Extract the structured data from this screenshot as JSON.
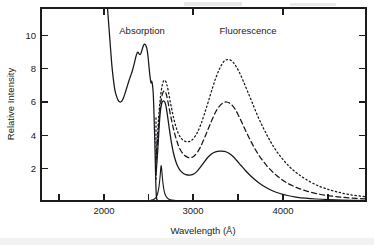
{
  "figure": {
    "background_color": "#ffffff",
    "ink_color": "#15161a"
  },
  "annotations": {
    "absorption_label": "Absorption",
    "fluorescence_label": "Fluorescence"
  },
  "axes": {
    "x_title": "Wavelength (Å)",
    "y_title": "Relative Intensity",
    "x_major_ticks": [
      "2000",
      "3000",
      "4000"
    ],
    "y_major_ticks": [
      "2",
      "4",
      "6",
      "8",
      "10"
    ]
  },
  "chart_data": {
    "type": "line",
    "title": "",
    "subtitle": "",
    "xlabel": "Wavelength (Å)",
    "ylabel": "Relative Intensity",
    "xlim": [
      1550,
      4800
    ],
    "ylim": [
      0,
      11.6
    ],
    "grid": false,
    "legend_position": "none",
    "frame": "box",
    "x_major_ticks": [
      2000,
      3000,
      4000
    ],
    "x_minor_ticks": [
      1500,
      2500,
      3500,
      4500
    ],
    "y_major_ticks": [
      2,
      4,
      6,
      8,
      10
    ],
    "y_minor_ticks": [],
    "annotations": [
      {
        "text": "Absorption",
        "x": 2530,
        "y": 10.6
      },
      {
        "text": "Fluorescence",
        "x": 3530,
        "y": 10.6
      }
    ],
    "series": [
      {
        "name": "Absorption",
        "style": "solid",
        "comment": "absorption band: descends from off-scale at 2200, min ~6.0 near 2350, rises to peak 9.4 at 2600, sharp cut-off at 2700",
        "points": [
          [
            2215,
            11.6
          ],
          [
            2230,
            10.4
          ],
          [
            2245,
            9.2
          ],
          [
            2258,
            8.2
          ],
          [
            2272,
            7.4
          ],
          [
            2288,
            6.7
          ],
          [
            2305,
            6.3
          ],
          [
            2322,
            6.05
          ],
          [
            2340,
            5.95
          ],
          [
            2358,
            6.0
          ],
          [
            2375,
            6.2
          ],
          [
            2392,
            6.5
          ],
          [
            2410,
            6.85
          ],
          [
            2428,
            7.2
          ],
          [
            2445,
            7.5
          ],
          [
            2462,
            7.8
          ],
          [
            2478,
            8.15
          ],
          [
            2492,
            8.5
          ],
          [
            2505,
            8.8
          ],
          [
            2518,
            8.95
          ],
          [
            2530,
            8.85
          ],
          [
            2542,
            8.8
          ],
          [
            2554,
            8.95
          ],
          [
            2566,
            9.2
          ],
          [
            2578,
            9.38
          ],
          [
            2590,
            9.42
          ],
          [
            2602,
            9.3
          ],
          [
            2612,
            9.05
          ],
          [
            2620,
            8.7
          ],
          [
            2628,
            8.2
          ],
          [
            2636,
            7.7
          ],
          [
            2643,
            7.35
          ],
          [
            2650,
            7.1
          ],
          [
            2656,
            7.2
          ],
          [
            2662,
            7.1
          ],
          [
            2668,
            6.8
          ],
          [
            2673,
            6.4
          ],
          [
            2678,
            5.6
          ],
          [
            2683,
            4.6
          ],
          [
            2688,
            3.6
          ],
          [
            2692,
            2.6
          ],
          [
            2696,
            1.6
          ],
          [
            2700,
            0.7
          ],
          [
            2705,
            0.2
          ],
          [
            2712,
            0.05
          ]
        ]
      },
      {
        "name": "Excitation line",
        "style": "solid",
        "comment": "narrow scattered-excitation spike at 2750, height 2.1",
        "points": [
          [
            2640,
            0.03
          ],
          [
            2670,
            0.08
          ],
          [
            2695,
            0.18
          ],
          [
            2712,
            0.35
          ],
          [
            2724,
            0.65
          ],
          [
            2734,
            1.05
          ],
          [
            2742,
            1.55
          ],
          [
            2748,
            2.0
          ],
          [
            2752,
            2.12
          ],
          [
            2757,
            1.9
          ],
          [
            2764,
            1.4
          ],
          [
            2772,
            0.95
          ],
          [
            2782,
            0.6
          ],
          [
            2794,
            0.36
          ],
          [
            2810,
            0.2
          ],
          [
            2830,
            0.11
          ],
          [
            2860,
            0.06
          ],
          [
            2900,
            0.03
          ],
          [
            2950,
            0.02
          ],
          [
            3000,
            0.02
          ]
        ]
      },
      {
        "name": "Fluorescence - lowest concentration (solid)",
        "style": "solid",
        "comment": "first band peak 6.0 at 2790, valley 1.55 at 3090, second band peak 3.0 at 3420, long tail",
        "points": [
          [
            2700,
            1.6
          ],
          [
            2708,
            2.2
          ],
          [
            2716,
            2.9
          ],
          [
            2724,
            3.7
          ],
          [
            2732,
            4.5
          ],
          [
            2740,
            5.15
          ],
          [
            2750,
            5.65
          ],
          [
            2762,
            5.95
          ],
          [
            2775,
            6.02
          ],
          [
            2788,
            5.95
          ],
          [
            2800,
            5.7
          ],
          [
            2812,
            5.25
          ],
          [
            2825,
            4.7
          ],
          [
            2840,
            4.05
          ],
          [
            2856,
            3.45
          ],
          [
            2874,
            2.9
          ],
          [
            2894,
            2.45
          ],
          [
            2916,
            2.1
          ],
          [
            2940,
            1.85
          ],
          [
            2968,
            1.68
          ],
          [
            3000,
            1.58
          ],
          [
            3035,
            1.55
          ],
          [
            3070,
            1.6
          ],
          [
            3105,
            1.75
          ],
          [
            3140,
            2.0
          ],
          [
            3178,
            2.3
          ],
          [
            3215,
            2.6
          ],
          [
            3255,
            2.82
          ],
          [
            3295,
            2.95
          ],
          [
            3340,
            3.0
          ],
          [
            3385,
            2.98
          ],
          [
            3425,
            2.88
          ],
          [
            3465,
            2.7
          ],
          [
            3505,
            2.45
          ],
          [
            3548,
            2.15
          ],
          [
            3592,
            1.85
          ],
          [
            3640,
            1.55
          ],
          [
            3690,
            1.28
          ],
          [
            3745,
            1.02
          ],
          [
            3805,
            0.8
          ],
          [
            3870,
            0.6
          ],
          [
            3940,
            0.45
          ],
          [
            4015,
            0.33
          ],
          [
            4100,
            0.24
          ],
          [
            4195,
            0.17
          ],
          [
            4300,
            0.12
          ],
          [
            4420,
            0.08
          ],
          [
            4560,
            0.05
          ],
          [
            4700,
            0.04
          ],
          [
            4790,
            0.03
          ]
        ]
      },
      {
        "name": "Fluorescence - medium concentration (dashed)",
        "style": "dashed",
        "comment": "first band peak ~6.6 at 2790, valley 2.6 at 3080, second band peak 5.95 at 3400",
        "points": [
          [
            2700,
            2.4
          ],
          [
            2710,
            3.2
          ],
          [
            2720,
            4.0
          ],
          [
            2730,
            4.8
          ],
          [
            2740,
            5.5
          ],
          [
            2752,
            6.05
          ],
          [
            2765,
            6.45
          ],
          [
            2778,
            6.6
          ],
          [
            2792,
            6.58
          ],
          [
            2806,
            6.35
          ],
          [
            2820,
            5.95
          ],
          [
            2836,
            5.45
          ],
          [
            2854,
            4.9
          ],
          [
            2874,
            4.35
          ],
          [
            2896,
            3.85
          ],
          [
            2920,
            3.4
          ],
          [
            2946,
            3.05
          ],
          [
            2975,
            2.8
          ],
          [
            3008,
            2.65
          ],
          [
            3042,
            2.6
          ],
          [
            3076,
            2.68
          ],
          [
            3110,
            2.9
          ],
          [
            3145,
            3.25
          ],
          [
            3182,
            3.75
          ],
          [
            3220,
            4.3
          ],
          [
            3258,
            4.85
          ],
          [
            3296,
            5.35
          ],
          [
            3335,
            5.7
          ],
          [
            3372,
            5.9
          ],
          [
            3408,
            5.95
          ],
          [
            3445,
            5.85
          ],
          [
            3482,
            5.6
          ],
          [
            3520,
            5.2
          ],
          [
            3560,
            4.7
          ],
          [
            3602,
            4.15
          ],
          [
            3648,
            3.6
          ],
          [
            3698,
            3.05
          ],
          [
            3752,
            2.55
          ],
          [
            3810,
            2.1
          ],
          [
            3875,
            1.7
          ],
          [
            3945,
            1.35
          ],
          [
            4020,
            1.05
          ],
          [
            4102,
            0.82
          ],
          [
            4192,
            0.62
          ],
          [
            4292,
            0.46
          ],
          [
            4400,
            0.34
          ],
          [
            4520,
            0.25
          ],
          [
            4650,
            0.18
          ],
          [
            4790,
            0.13
          ]
        ]
      },
      {
        "name": "Fluorescence - highest concentration (dotted)",
        "style": "dotted",
        "comment": "first band peak 7.25 at 2790, valley 3.6 at 3070, second band peak 8.5 at 3430",
        "points": [
          [
            2700,
            2.6
          ],
          [
            2710,
            3.5
          ],
          [
            2720,
            4.45
          ],
          [
            2730,
            5.3
          ],
          [
            2741,
            6.05
          ],
          [
            2753,
            6.65
          ],
          [
            2766,
            7.05
          ],
          [
            2780,
            7.25
          ],
          [
            2794,
            7.22
          ],
          [
            2808,
            7.0
          ],
          [
            2823,
            6.6
          ],
          [
            2840,
            6.05
          ],
          [
            2858,
            5.5
          ],
          [
            2878,
            4.95
          ],
          [
            2900,
            4.45
          ],
          [
            2924,
            4.05
          ],
          [
            2950,
            3.78
          ],
          [
            2980,
            3.62
          ],
          [
            3012,
            3.56
          ],
          [
            3045,
            3.6
          ],
          [
            3078,
            3.78
          ],
          [
            3112,
            4.1
          ],
          [
            3148,
            4.6
          ],
          [
            3185,
            5.25
          ],
          [
            3222,
            5.95
          ],
          [
            3260,
            6.7
          ],
          [
            3298,
            7.4
          ],
          [
            3336,
            7.95
          ],
          [
            3374,
            8.35
          ],
          [
            3412,
            8.5
          ],
          [
            3450,
            8.45
          ],
          [
            3488,
            8.2
          ],
          [
            3528,
            7.8
          ],
          [
            3570,
            7.25
          ],
          [
            3615,
            6.6
          ],
          [
            3663,
            5.9
          ],
          [
            3714,
            5.15
          ],
          [
            3768,
            4.45
          ],
          [
            3826,
            3.78
          ],
          [
            3888,
            3.15
          ],
          [
            3955,
            2.6
          ],
          [
            4028,
            2.1
          ],
          [
            4108,
            1.68
          ],
          [
            4195,
            1.32
          ],
          [
            4290,
            1.0
          ],
          [
            4395,
            0.75
          ],
          [
            4510,
            0.55
          ],
          [
            4640,
            0.38
          ],
          [
            4790,
            0.26
          ]
        ]
      },
      {
        "name": "Vertical excitation cut (dotted/dashed edge at 2700)",
        "style": "vertical-dotted",
        "comment": "short vertical dotted segment at 2700 from 1.6 up to 5.0 marking excitation cut-off",
        "x": 2700,
        "y_from": 1.3,
        "y_to": 5.0
      }
    ]
  }
}
